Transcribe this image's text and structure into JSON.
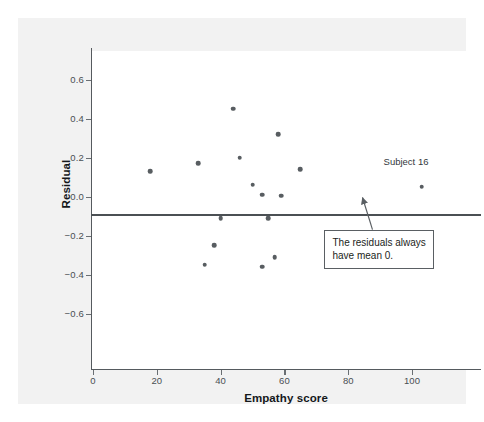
{
  "chart_data": {
    "type": "scatter",
    "title": "",
    "xlabel": "Empathy score",
    "ylabel": "Residual",
    "xlim": [
      -5,
      115
    ],
    "ylim": [
      -0.75,
      0.72
    ],
    "xticks": [
      "0",
      "20",
      "40",
      "60",
      "80",
      "100"
    ],
    "xtick_values": [
      0,
      20,
      40,
      60,
      80,
      100
    ],
    "yticks": [
      "0.6",
      "0.4",
      "0.2",
      "0.0",
      "−0.2",
      "−0.4",
      "−0.6"
    ],
    "ytick_values": [
      0.6,
      0.4,
      0.2,
      0.0,
      -0.2,
      -0.4,
      -0.6
    ],
    "grid": false,
    "legend": null,
    "reference_line": {
      "y": 0.0,
      "label": "zero residual line"
    },
    "points": [
      {
        "x": 18,
        "y": 0.13
      },
      {
        "x": 33,
        "y": 0.17
      },
      {
        "x": 44,
        "y": 0.45
      },
      {
        "x": 46,
        "y": 0.2
      },
      {
        "x": 58,
        "y": 0.32
      },
      {
        "x": 50,
        "y": 0.06
      },
      {
        "x": 53,
        "y": 0.01
      },
      {
        "x": 59,
        "y": 0.005
      },
      {
        "x": 65,
        "y": 0.14
      },
      {
        "x": 40,
        "y": -0.11
      },
      {
        "x": 55,
        "y": -0.11
      },
      {
        "x": 38,
        "y": -0.25
      },
      {
        "x": 35,
        "y": -0.35
      },
      {
        "x": 57,
        "y": -0.31
      },
      {
        "x": 53,
        "y": -0.36
      },
      {
        "x": 103,
        "y": 0.05
      }
    ],
    "annotations": [
      {
        "name": "subject-16-label",
        "text": "Subject 16",
        "x": 103,
        "y": 0.17
      },
      {
        "name": "mean-zero-callout",
        "text": "The residuals always have mean 0.",
        "x": 92,
        "y": -0.18
      }
    ]
  },
  "colors": {
    "point": "#585d61",
    "axis": "#555a5e",
    "zero_line": "#4b5054",
    "panel_background": "#f2f2f2",
    "plot_background": "#ffffff",
    "text": "#15181b"
  }
}
